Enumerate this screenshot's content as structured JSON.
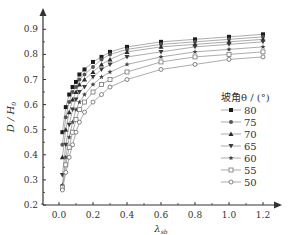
{
  "chart_data": {
    "type": "line",
    "title": "",
    "xlabel": "λ_sb",
    "ylabel": "D / H_0",
    "xlim": [
      -0.1,
      1.3
    ],
    "ylim": [
      0.2,
      0.95
    ],
    "xticks": [
      0.0,
      0.2,
      0.4,
      0.6,
      0.8,
      1.0,
      1.2
    ],
    "yticks": [
      0.2,
      0.3,
      0.4,
      0.5,
      0.6,
      0.7,
      0.8,
      0.9
    ],
    "grid": false,
    "legend_title": "坡角θ / (°)",
    "legend_position": "right",
    "x": [
      0.02,
      0.04,
      0.06,
      0.08,
      0.1,
      0.12,
      0.15,
      0.2,
      0.25,
      0.3,
      0.4,
      0.6,
      0.8,
      1.0,
      1.2
    ],
    "series": [
      {
        "name": "80",
        "marker": "square-filled",
        "values": [
          0.49,
          0.59,
          0.64,
          0.67,
          0.69,
          0.72,
          0.74,
          0.77,
          0.79,
          0.81,
          0.83,
          0.85,
          0.86,
          0.87,
          0.88
        ]
      },
      {
        "name": "75",
        "marker": "circle-filled",
        "values": [
          0.44,
          0.55,
          0.61,
          0.65,
          0.67,
          0.7,
          0.72,
          0.75,
          0.78,
          0.8,
          0.82,
          0.84,
          0.85,
          0.86,
          0.87
        ]
      },
      {
        "name": "70",
        "marker": "triangle-up-filled",
        "values": [
          0.39,
          0.5,
          0.57,
          0.62,
          0.65,
          0.68,
          0.7,
          0.73,
          0.76,
          0.78,
          0.81,
          0.83,
          0.84,
          0.85,
          0.86
        ]
      },
      {
        "name": "65",
        "marker": "triangle-down-filled",
        "values": [
          0.32,
          0.44,
          0.52,
          0.58,
          0.62,
          0.65,
          0.67,
          0.71,
          0.74,
          0.76,
          0.79,
          0.81,
          0.83,
          0.84,
          0.85
        ]
      },
      {
        "name": "60",
        "marker": "star-filled",
        "values": [
          0.28,
          0.39,
          0.47,
          0.53,
          0.58,
          0.61,
          0.64,
          0.68,
          0.71,
          0.73,
          0.76,
          0.79,
          0.81,
          0.82,
          0.83
        ]
      },
      {
        "name": "55",
        "marker": "square-open",
        "values": [
          0.27,
          0.36,
          0.43,
          0.49,
          0.54,
          0.58,
          0.61,
          0.65,
          0.68,
          0.7,
          0.73,
          0.77,
          0.79,
          0.8,
          0.81
        ]
      },
      {
        "name": "50",
        "marker": "circle-open",
        "values": [
          0.26,
          0.33,
          0.39,
          0.44,
          0.49,
          0.53,
          0.57,
          0.61,
          0.64,
          0.67,
          0.7,
          0.74,
          0.76,
          0.78,
          0.79
        ]
      }
    ]
  },
  "legend": {
    "title": "坡角θ / (°)",
    "items": [
      "80",
      "75",
      "70",
      "65",
      "60",
      "55",
      "50"
    ]
  },
  "axes": {
    "x_label_main": "λ",
    "x_label_sub": "sb",
    "y_label_main": "D / H",
    "y_label_sub": "0",
    "x_tick_labels": [
      "0.0",
      "0.2",
      "0.4",
      "0.6",
      "0.8",
      "1.0",
      "1.2"
    ],
    "y_tick_labels": [
      "0.2",
      "0.3",
      "0.4",
      "0.5",
      "0.6",
      "0.7",
      "0.8",
      "0.9"
    ]
  }
}
